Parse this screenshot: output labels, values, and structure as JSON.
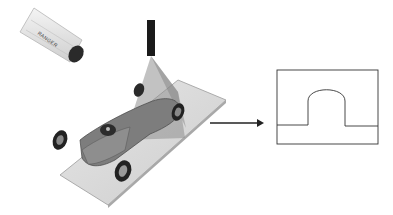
{
  "diagram": {
    "components": [
      {
        "id": "camera",
        "label": "RANGER",
        "kind": "camera"
      },
      {
        "id": "laser",
        "kind": "laser-line-projector"
      },
      {
        "id": "object",
        "kind": "model-race-car-on-plate"
      },
      {
        "id": "arrow",
        "kind": "flow-arrow"
      },
      {
        "id": "profile",
        "kind": "height-profile-plot"
      }
    ],
    "camera_label": "RANGER",
    "colors": {
      "plate": "#d9d9d9",
      "laser_plane": "#9a9a9a",
      "car_body": "#7a7a7a",
      "sensor": "#1a1a1a",
      "line": "#222222"
    }
  }
}
